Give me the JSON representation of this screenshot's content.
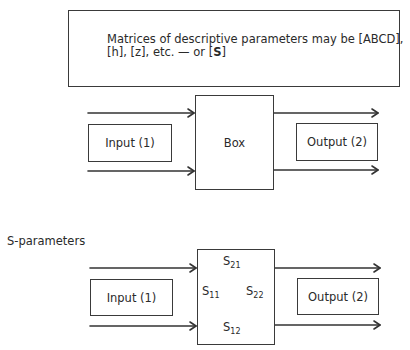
{
  "note": {
    "line1": "Matrices of descriptive parameters may be [ABCD],",
    "line2_prefix": "[h], [z], etc. — or [",
    "line2_bold": "S",
    "line2_suffix": "]"
  },
  "diagram_top": {
    "input_label": "Input (1)",
    "box_label": "Box",
    "output_label": "Output (2)"
  },
  "section_title": "S-parameters",
  "diagram_bottom": {
    "input_label": "Input (1)",
    "output_label": "Output (2)",
    "params": {
      "s21": {
        "base": "S",
        "sub": "21"
      },
      "s11": {
        "base": "S",
        "sub": "11"
      },
      "s22": {
        "base": "S",
        "sub": "22"
      },
      "s12": {
        "base": "S",
        "sub": "12"
      }
    }
  },
  "colors": {
    "stroke": "#333333",
    "text": "#2a2a2a",
    "background": "#ffffff"
  }
}
